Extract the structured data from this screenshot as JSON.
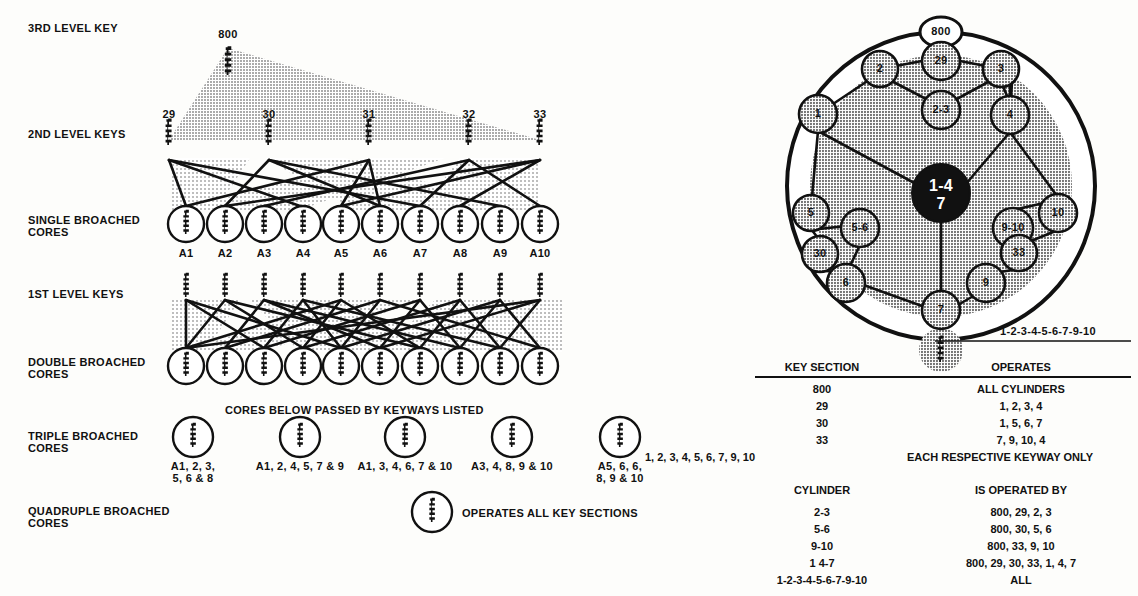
{
  "left_diagram": {
    "row_labels": [
      {
        "id": "third-level-key",
        "text": "3RD LEVEL KEY",
        "x": 28,
        "y": 22
      },
      {
        "id": "second-level-keys",
        "text": "2ND LEVEL KEYS",
        "x": 28,
        "y": 128
      },
      {
        "id": "single-broached-cores",
        "text": "SINGLE BROACHED\nCORES",
        "x": 28,
        "y": 214
      },
      {
        "id": "first-level-keys",
        "text": "1ST LEVEL KEYS",
        "x": 28,
        "y": 288
      },
      {
        "id": "double-broached-cores",
        "text": "DOUBLE BROACHED\nCORES",
        "x": 28,
        "y": 350
      },
      {
        "id": "triple-broached-cores",
        "text": "TRIPLE BROACHED\nCORES",
        "x": 28,
        "y": 437
      },
      {
        "id": "quadruple-broached-cores",
        "text": "QUADRUPLE BROACHED\nCORES",
        "x": 28,
        "y": 512
      }
    ],
    "third_level_key": {
      "label": "800",
      "x": 228,
      "y": 30
    },
    "second_level_keys": [
      {
        "label": "29",
        "x": 169
      },
      {
        "label": "30",
        "x": 269
      },
      {
        "label": "31",
        "x": 369
      },
      {
        "label": "32",
        "x": 469
      },
      {
        "label": "33",
        "x": 540
      }
    ],
    "single_broached_cores": [
      {
        "label": "A1"
      },
      {
        "label": "A2"
      },
      {
        "label": "A3"
      },
      {
        "label": "A4"
      },
      {
        "label": "A5"
      },
      {
        "label": "A6"
      },
      {
        "label": "A7"
      },
      {
        "label": "A8"
      },
      {
        "label": "A9"
      },
      {
        "label": "A10"
      }
    ],
    "double_broached_count": 10,
    "cores_note": {
      "text": "CORES BELOW PASSED BY KEYWAYS LISTED",
      "x": 225,
      "y": 404
    },
    "triple_broached_cores": [
      {
        "cx": 193,
        "label": "A1, 2, 3,\n5, 6 & 8"
      },
      {
        "cx": 300,
        "label": "A1, 2, 4, 5, 7 & 9"
      },
      {
        "cx": 405,
        "label": "A1, 3, 4, 6, 7 & 10"
      },
      {
        "cx": 512,
        "label": "A3, 4, 8, 9 & 10"
      },
      {
        "cx": 620,
        "label": "A5, 6, 6,\n8, 9 & 10"
      }
    ],
    "quadruple_broached": {
      "cx": 432,
      "cy": 512,
      "note": "OPERATES ALL KEY SECTIONS",
      "note_x": 462,
      "note_y": 507
    }
  },
  "right_diagram": {
    "outer_ring": {
      "cx": 941,
      "cy": 186,
      "r": 154
    },
    "inner_shaded": {
      "cx": 941,
      "cy": 186,
      "r": 131
    },
    "center_node": {
      "label_top": "1-4",
      "label_bottom": "7",
      "cx": 941,
      "cy": 193,
      "r": 29
    },
    "top_node": {
      "label": "800",
      "cx": 941,
      "cy": 32,
      "rx": 21,
      "ry": 15
    },
    "bottom_key": {
      "cx": 941,
      "cy": 350,
      "r": 22
    },
    "nodes": [
      {
        "id": "node-2",
        "label": "2",
        "cx": 880,
        "cy": 69,
        "r": 18
      },
      {
        "id": "node-29",
        "label": "29",
        "cx": 941,
        "cy": 61,
        "r": 19
      },
      {
        "id": "node-3",
        "label": "3",
        "cx": 1001,
        "cy": 69,
        "r": 18
      },
      {
        "id": "node-2-3",
        "label": "2-3",
        "cx": 941,
        "cy": 110,
        "r": 19
      },
      {
        "id": "node-1",
        "label": "1",
        "cx": 818,
        "cy": 114,
        "r": 19
      },
      {
        "id": "node-4",
        "label": "4",
        "cx": 1010,
        "cy": 115,
        "r": 19
      },
      {
        "id": "node-5",
        "label": "5",
        "cx": 811,
        "cy": 213,
        "r": 18
      },
      {
        "id": "node-5-6",
        "label": "5-6",
        "cx": 860,
        "cy": 228,
        "r": 19
      },
      {
        "id": "node-30",
        "label": "30",
        "cx": 820,
        "cy": 254,
        "r": 18
      },
      {
        "id": "node-6",
        "label": "6",
        "cx": 846,
        "cy": 283,
        "r": 19
      },
      {
        "id": "node-9-10",
        "label": "9-10",
        "cx": 1013,
        "cy": 228,
        "r": 20
      },
      {
        "id": "node-10",
        "label": "10",
        "cx": 1058,
        "cy": 213,
        "r": 19
      },
      {
        "id": "node-33",
        "label": "33",
        "cx": 1019,
        "cy": 253,
        "r": 18
      },
      {
        "id": "node-9",
        "label": "9",
        "cx": 986,
        "cy": 283,
        "r": 19
      },
      {
        "id": "node-7",
        "label": "7",
        "cx": 941,
        "cy": 310,
        "r": 19
      }
    ],
    "side_note": {
      "text": "1-2-3-4-5-6-7-9-10",
      "x": 1000,
      "y": 333
    }
  },
  "table_key_section": {
    "headers": {
      "left": "KEY SECTION",
      "right": "OPERATES"
    },
    "rows": [
      {
        "left": "800",
        "right": "ALL CYLINDERS"
      },
      {
        "left": "29",
        "right": "1, 2, 3, 4"
      },
      {
        "left": "30",
        "right": "1, 5, 6, 7"
      },
      {
        "left": "33",
        "right": "7, 9, 10, 4"
      },
      {
        "left": "1, 2, 3, 4, 5, 6, 7, 9, 10",
        "right": "EACH RESPECTIVE KEYWAY ONLY"
      }
    ]
  },
  "table_cylinder": {
    "headers": {
      "left": "CYLINDER",
      "right": "IS OPERATED BY"
    },
    "rows": [
      {
        "left": "2-3",
        "right": "800, 29, 2, 3"
      },
      {
        "left": "5-6",
        "right": "800, 30, 5, 6"
      },
      {
        "left": "9-10",
        "right": "800, 33, 9, 10"
      },
      {
        "left": "1 4-7",
        "right": "800, 29, 30, 33, 1, 4, 7"
      },
      {
        "left": "1-2-3-4-5-6-7-9-10",
        "right": "ALL"
      }
    ]
  },
  "colors": {
    "ink": "#111111",
    "shade_light": "#c9c9c9",
    "shade_mid": "#b3b3b3",
    "shade_dark": "#9a9a9a",
    "paper": "#fdfdfb"
  }
}
